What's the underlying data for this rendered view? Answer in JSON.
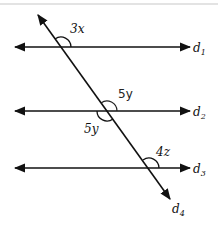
{
  "diagram": {
    "type": "parallel lines cut by a transversal",
    "lines": [
      {
        "id": "d1",
        "label": "d",
        "subscript": "1",
        "y": 47
      },
      {
        "id": "d2",
        "label": "d",
        "subscript": "2",
        "y": 111
      },
      {
        "id": "d3",
        "label": "d",
        "subscript": "3",
        "y": 168
      }
    ],
    "transversal": {
      "id": "d4",
      "label": "d",
      "subscript": "4"
    },
    "angles": [
      {
        "line": "d1",
        "label": "3x",
        "position": "above-right"
      },
      {
        "line": "d2",
        "label": "5y",
        "position": "above-right",
        "style": "handwritten"
      },
      {
        "line": "d2",
        "label": "5y",
        "position": "below-left"
      },
      {
        "line": "d3",
        "label": "4z",
        "position": "above-right"
      }
    ],
    "colors": {
      "stroke": "#111111",
      "frame_line": "#c8c8c8"
    }
  }
}
